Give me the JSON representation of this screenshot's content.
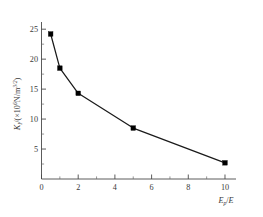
{
  "chart_data": {
    "type": "line",
    "title": "",
    "xlabel": "E_p/E",
    "ylabel": "K_I/(×10⁶ N/m^3/2)",
    "x": [
      0.5,
      1,
      2,
      5,
      10
    ],
    "values": [
      24.2,
      18.5,
      14.3,
      8.5,
      2.7
    ],
    "series": [
      {
        "name": "K_I",
        "x": [
          0.5,
          1,
          2,
          5,
          10
        ],
        "values": [
          24.2,
          18.5,
          14.3,
          8.5,
          2.7
        ]
      }
    ],
    "xlim": [
      0,
      10.6
    ],
    "ylim": [
      0,
      26.2
    ],
    "xticks": [
      0,
      2,
      4,
      6,
      8,
      10
    ],
    "xtick_labels": [
      "0",
      "2",
      "4",
      "6",
      "8",
      "10"
    ],
    "xminor_step": 1,
    "yticks": [
      5,
      10,
      15,
      20,
      25
    ],
    "ytick_labels": [
      "5",
      "10",
      "15",
      "20",
      "25"
    ],
    "yminor_step": 2.5,
    "grid": false,
    "legend": null,
    "marker": "square",
    "line_color": "#1a1a1a",
    "marker_color": "#000000",
    "axis_color": "#4a4a4a"
  },
  "axes": {
    "y_title": {
      "symbol": "K",
      "symbol_sub": "I",
      "divider": "/(",
      "times": "×10",
      "times_exp": "6",
      "unit": "N/m",
      "unit_exp": "3/2",
      "close": ")"
    },
    "x_title": {
      "symbol": "E",
      "symbol_sub": "p",
      "divider": "/",
      "denominator": "E"
    }
  }
}
